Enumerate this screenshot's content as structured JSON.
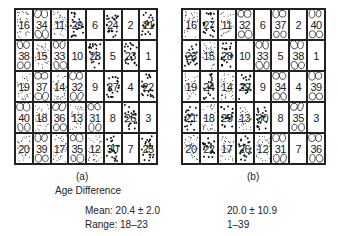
{
  "figure": {
    "panels": [
      {
        "id": "a",
        "caption": "(a)",
        "grid": [
          [
            16,
            34,
            11,
            29,
            6,
            24,
            2,
            21
          ],
          [
            38,
            15,
            33,
            10,
            28,
            5,
            23,
            1
          ],
          [
            19,
            37,
            14,
            32,
            9,
            27,
            4,
            22
          ],
          [
            40,
            18,
            36,
            13,
            31,
            8,
            26,
            3
          ],
          [
            20,
            39,
            17,
            35,
            12,
            30,
            7,
            25
          ]
        ],
        "stats": {
          "mean": "Mean: 20.4 ± 2.0",
          "range": "Range: 18–23"
        }
      },
      {
        "id": "b",
        "caption": "(b)",
        "grid": [
          [
            16,
            27,
            11,
            32,
            6,
            37,
            2,
            40
          ],
          [
            23,
            15,
            28,
            10,
            33,
            5,
            38,
            1
          ],
          [
            19,
            24,
            14,
            29,
            9,
            34,
            4,
            39
          ],
          [
            21,
            18,
            25,
            13,
            30,
            8,
            35,
            3
          ],
          [
            20,
            22,
            17,
            26,
            12,
            31,
            7,
            36
          ]
        ],
        "stats": {
          "mean": "20.0 ± 10.9",
          "range": "1–39"
        }
      }
    ],
    "section_title": "Age Difference",
    "pattern_legend": {
      "blank": "1–10",
      "fine-dots": "11–20",
      "coarse-dots": "21–30",
      "ovals": "31–40"
    }
  }
}
